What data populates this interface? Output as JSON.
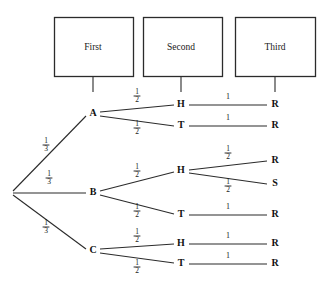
{
  "diagram": {
    "type": "probability-tree",
    "background_color": "#ffffff",
    "line_color": "#2b2b2b",
    "text_color": "#1a1a1a"
  },
  "stage_headers": [
    {
      "label": "First",
      "x": 93,
      "box": {
        "x": 54,
        "y": 17,
        "w": 79,
        "h": 59
      }
    },
    {
      "label": "Second",
      "x": 181,
      "box": {
        "x": 143,
        "y": 17,
        "w": 79,
        "h": 59
      }
    },
    {
      "label": "Third",
      "x": 275,
      "box": {
        "x": 235,
        "y": 17,
        "w": 80,
        "h": 59
      }
    }
  ],
  "stage_ticks": [
    {
      "x": 93,
      "y1": 77,
      "y2": 92
    },
    {
      "x": 181,
      "y1": 77,
      "y2": 92
    },
    {
      "x": 275,
      "y1": 77,
      "y2": 92
    }
  ],
  "root": {
    "x": 11,
    "y": 193
  },
  "nodes": [
    {
      "id": "A",
      "label": "A",
      "x": 93,
      "y": 114,
      "stage": 1
    },
    {
      "id": "B",
      "label": "B",
      "x": 93,
      "y": 193,
      "stage": 1
    },
    {
      "id": "C",
      "label": "C",
      "x": 93,
      "y": 251,
      "stage": 1
    },
    {
      "id": "AH",
      "label": "H",
      "x": 181,
      "y": 105,
      "stage": 2
    },
    {
      "id": "AT",
      "label": "T",
      "x": 181,
      "y": 126,
      "stage": 2
    },
    {
      "id": "BH",
      "label": "H",
      "x": 181,
      "y": 171,
      "stage": 2
    },
    {
      "id": "BT",
      "label": "T",
      "x": 181,
      "y": 215,
      "stage": 2
    },
    {
      "id": "CH",
      "label": "H",
      "x": 181,
      "y": 244,
      "stage": 2
    },
    {
      "id": "CT",
      "label": "T",
      "x": 181,
      "y": 264,
      "stage": 2
    },
    {
      "id": "AHR",
      "label": "R",
      "x": 275,
      "y": 105,
      "stage": 3
    },
    {
      "id": "ATR",
      "label": "R",
      "x": 275,
      "y": 126,
      "stage": 3
    },
    {
      "id": "BHR",
      "label": "R",
      "x": 275,
      "y": 161,
      "stage": 3
    },
    {
      "id": "BHS",
      "label": "S",
      "x": 275,
      "y": 184,
      "stage": 3
    },
    {
      "id": "BTR",
      "label": "R",
      "x": 275,
      "y": 215,
      "stage": 3
    },
    {
      "id": "CHR",
      "label": "R",
      "x": 275,
      "y": 244,
      "stage": 3
    },
    {
      "id": "CTR",
      "label": "R",
      "x": 275,
      "y": 264,
      "stage": 3
    }
  ],
  "edges": [
    {
      "from": "root",
      "to": "A",
      "x1": 13,
      "y1": 191,
      "x2": 86,
      "y2": 116
    },
    {
      "from": "root",
      "to": "B",
      "x1": 13,
      "y1": 193,
      "x2": 86,
      "y2": 193
    },
    {
      "from": "root",
      "to": "C",
      "x1": 13,
      "y1": 195,
      "x2": 86,
      "y2": 249
    },
    {
      "from": "A",
      "to": "AH",
      "x1": 100,
      "y1": 112,
      "x2": 174,
      "y2": 105
    },
    {
      "from": "A",
      "to": "AT",
      "x1": 100,
      "y1": 116,
      "x2": 174,
      "y2": 126
    },
    {
      "from": "B",
      "to": "BH",
      "x1": 100,
      "y1": 191,
      "x2": 174,
      "y2": 172
    },
    {
      "from": "B",
      "to": "BT",
      "x1": 100,
      "y1": 195,
      "x2": 174,
      "y2": 214
    },
    {
      "from": "C",
      "to": "CH",
      "x1": 100,
      "y1": 249,
      "x2": 174,
      "y2": 244
    },
    {
      "from": "C",
      "to": "CT",
      "x1": 100,
      "y1": 253,
      "x2": 174,
      "y2": 263
    },
    {
      "from": "AH",
      "to": "AHR",
      "x1": 189,
      "y1": 105,
      "x2": 267,
      "y2": 105
    },
    {
      "from": "AT",
      "to": "ATR",
      "x1": 189,
      "y1": 126,
      "x2": 267,
      "y2": 126
    },
    {
      "from": "BH",
      "to": "BHR",
      "x1": 189,
      "y1": 170,
      "x2": 267,
      "y2": 161
    },
    {
      "from": "BH",
      "to": "BHS",
      "x1": 189,
      "y1": 173,
      "x2": 267,
      "y2": 184
    },
    {
      "from": "BT",
      "to": "BTR",
      "x1": 189,
      "y1": 215,
      "x2": 267,
      "y2": 215
    },
    {
      "from": "CH",
      "to": "CHR",
      "x1": 189,
      "y1": 244,
      "x2": 267,
      "y2": 244
    },
    {
      "from": "CT",
      "to": "CTR",
      "x1": 189,
      "y1": 264,
      "x2": 267,
      "y2": 264
    }
  ],
  "edge_labels": [
    {
      "edge": "root-A",
      "kind": "fraction",
      "numerator": "1",
      "denominator": "3",
      "x": 46,
      "y": 145
    },
    {
      "edge": "root-B",
      "kind": "fraction",
      "numerator": "1",
      "denominator": "3",
      "x": 49,
      "y": 178
    },
    {
      "edge": "root-C",
      "kind": "fraction",
      "numerator": "1",
      "denominator": "3",
      "x": 46,
      "y": 227
    },
    {
      "edge": "A-AH",
      "kind": "fraction",
      "numerator": "1",
      "denominator": "2",
      "x": 137,
      "y": 96
    },
    {
      "edge": "A-AT",
      "kind": "fraction",
      "numerator": "1",
      "denominator": "2",
      "x": 137,
      "y": 128
    },
    {
      "edge": "B-BH",
      "kind": "fraction",
      "numerator": "1",
      "denominator": "2",
      "x": 137,
      "y": 171
    },
    {
      "edge": "B-BT",
      "kind": "fraction",
      "numerator": "1",
      "denominator": "2",
      "x": 137,
      "y": 211
    },
    {
      "edge": "C-CH",
      "kind": "fraction",
      "numerator": "1",
      "denominator": "2",
      "x": 137,
      "y": 236
    },
    {
      "edge": "C-CT",
      "kind": "fraction",
      "numerator": "1",
      "denominator": "2",
      "x": 137,
      "y": 267
    },
    {
      "edge": "BH-BHR",
      "kind": "fraction",
      "numerator": "1",
      "denominator": "2",
      "x": 228,
      "y": 153
    },
    {
      "edge": "BH-BHS",
      "kind": "fraction",
      "numerator": "1",
      "denominator": "2",
      "x": 228,
      "y": 186
    },
    {
      "edge": "AH-AHR",
      "kind": "whole",
      "value": "1",
      "x": 228,
      "y": 97
    },
    {
      "edge": "AT-ATR",
      "kind": "whole",
      "value": "1",
      "x": 228,
      "y": 118
    },
    {
      "edge": "BT-BTR",
      "kind": "whole",
      "value": "1",
      "x": 228,
      "y": 207
    },
    {
      "edge": "CH-CHR",
      "kind": "whole",
      "value": "1",
      "x": 228,
      "y": 236
    },
    {
      "edge": "CT-CTR",
      "kind": "whole",
      "value": "1",
      "x": 228,
      "y": 256
    }
  ],
  "chart_data": {
    "type": "tree",
    "stages": [
      "First",
      "Second",
      "Third"
    ],
    "paths": [
      {
        "sequence": [
          "A",
          "H",
          "R"
        ],
        "probabilities": [
          "1/3",
          "1/2",
          "1"
        ]
      },
      {
        "sequence": [
          "A",
          "T",
          "R"
        ],
        "probabilities": [
          "1/3",
          "1/2",
          "1"
        ]
      },
      {
        "sequence": [
          "B",
          "H",
          "R"
        ],
        "probabilities": [
          "1/3",
          "1/2",
          "1/2"
        ]
      },
      {
        "sequence": [
          "B",
          "H",
          "S"
        ],
        "probabilities": [
          "1/3",
          "1/2",
          "1/2"
        ]
      },
      {
        "sequence": [
          "B",
          "T",
          "R"
        ],
        "probabilities": [
          "1/3",
          "1/2",
          "1"
        ]
      },
      {
        "sequence": [
          "C",
          "H",
          "R"
        ],
        "probabilities": [
          "1/3",
          "1/2",
          "1"
        ]
      },
      {
        "sequence": [
          "C",
          "T",
          "R"
        ],
        "probabilities": [
          "1/3",
          "1/2",
          "1"
        ]
      }
    ]
  }
}
